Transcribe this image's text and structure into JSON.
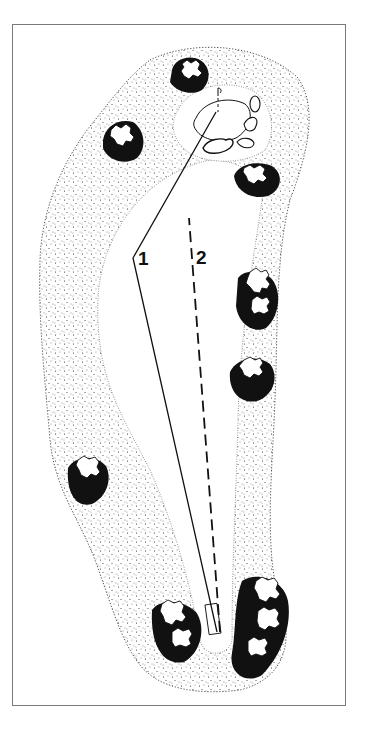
{
  "diagram": {
    "type": "golf-hole-layout",
    "frame": {
      "border_color": "#7a7a7a"
    },
    "routes": [
      {
        "id": "1",
        "label": "1",
        "style": "solid"
      },
      {
        "id": "2",
        "label": "2",
        "style": "dashed"
      }
    ],
    "elements": [
      "rough",
      "fairway",
      "green",
      "flagstick",
      "bunkers",
      "tree-clusters",
      "tee-box"
    ],
    "colors": {
      "ink": "#111111",
      "paper": "#ffffff"
    }
  }
}
